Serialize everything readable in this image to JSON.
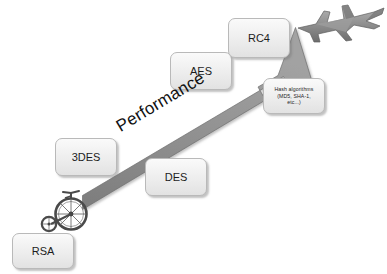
{
  "diagram": {
    "background_color": "#ffffff",
    "arrow": {
      "label": "Performance",
      "color": "#8a8a8a",
      "direction": "up-right",
      "angle_degrees": -31
    },
    "boxes": [
      {
        "id": "rsa",
        "label": "RSA",
        "fill": "#f1f1f1",
        "border": "#b9b9b9"
      },
      {
        "id": "3des",
        "label": "3DES",
        "fill": "#f1f1f1",
        "border": "#b9b9b9"
      },
      {
        "id": "des",
        "label": "DES",
        "fill": "#f1f1f1",
        "border": "#b9b9b9"
      },
      {
        "id": "aes",
        "label": "AES",
        "fill": "#f1f1f1",
        "border": "#b9b9b9"
      },
      {
        "id": "rc4",
        "label": "RC4",
        "fill": "#f1f1f1",
        "border": "#b9b9b9"
      },
      {
        "id": "hash",
        "label": "Hash algorithms (MD5, SHA-1, etc...)",
        "fill": "#f1f1f1",
        "border": "#b9b9b9"
      }
    ],
    "hash_box": {
      "line1": "Hash algorithms",
      "line2": "(MD5, SHA-1,",
      "line3": "etc...)"
    },
    "illustrations": [
      {
        "id": "bicycle",
        "name": "penny-farthing-bicycle-icon",
        "meaning": "slowest"
      },
      {
        "id": "jet",
        "name": "fighter-jet-icon",
        "meaning": "fastest"
      }
    ]
  }
}
